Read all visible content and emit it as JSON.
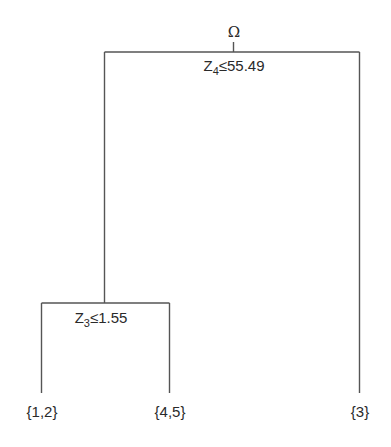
{
  "tree": {
    "root": {
      "label": "Ω",
      "split": {
        "var": "Z",
        "index": "4",
        "op": "≤",
        "value": "55.49"
      }
    },
    "internal": {
      "split": {
        "var": "Z",
        "index": "3",
        "op": "≤",
        "value": "1.55"
      }
    },
    "leaves": [
      {
        "label": "{1,2}"
      },
      {
        "label": "{4,5}"
      },
      {
        "label": "{3}"
      }
    ]
  },
  "colors": {
    "line": "#555555",
    "text": "#2a2a2a"
  }
}
